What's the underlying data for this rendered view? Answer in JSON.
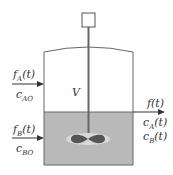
{
  "diagram": {
    "colors": {
      "liquid": "#b9b9b9",
      "outline": "#555555",
      "text": "#333333"
    },
    "labels": {
      "feed_a_flow": "f_A(t)",
      "feed_a_conc": "c_AO",
      "feed_b_flow": "f_B(t)",
      "feed_b_conc": "c_BO",
      "volume": "V",
      "out_flow": "f(t)",
      "out_conc_a": "c_A(t)",
      "out_conc_b": "c_B(t)"
    }
  }
}
